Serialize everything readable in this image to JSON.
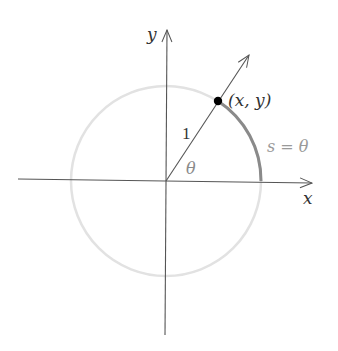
{
  "diagram": {
    "labels": {
      "y_axis": "y",
      "x_axis": "x",
      "point": "(x, y)",
      "radius": "1",
      "angle": "θ",
      "arc": "s = θ"
    },
    "colors": {
      "axes": "#555555",
      "circle": "#e0e0e0",
      "arc": "#8a8a8a",
      "radial_line": "#555555",
      "point": "#000000",
      "text": "#333333",
      "arc_label": "#9a9a9a",
      "angle_label": "#8a8a8a"
    },
    "geometry": {
      "center": [
        166,
        181
      ],
      "radius": 95,
      "angle_deg": 57
    }
  }
}
